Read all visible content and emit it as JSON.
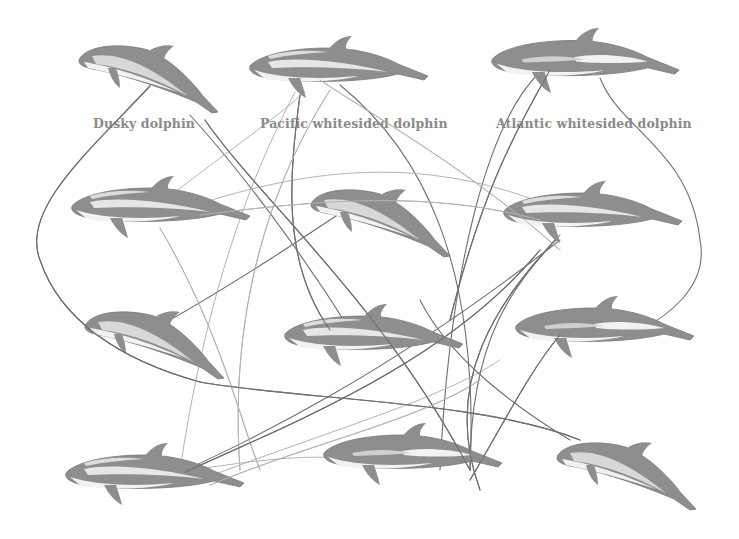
{
  "worksheet": {
    "reference_labels": [
      {
        "id": "dusky",
        "text": "Dusky dolphin",
        "x": 93,
        "y": 116
      },
      {
        "id": "pacific",
        "text": "Pacific whitesided dolphin",
        "x": 260,
        "y": 116
      },
      {
        "id": "atlantic",
        "text": "Atlantic whitesided dolphin",
        "x": 496,
        "y": 116
      }
    ],
    "colors": {
      "background": "#ffffff",
      "dolphin_dark": "#8e8e8e",
      "dolphin_light": "#f2f2f2",
      "label_text": "#8a8a8a",
      "pencil_dark": "#6f6f6f",
      "pencil_light": "#b4b4b4"
    },
    "dolphins": [
      {
        "name": "reference-dusky",
        "type": "dusky",
        "pose": "diving",
        "x": 78,
        "y": 40,
        "scale": 1.0
      },
      {
        "name": "reference-pacific",
        "type": "pacific",
        "pose": "swimming",
        "x": 248,
        "y": 38,
        "scale": 1.0
      },
      {
        "name": "reference-atlantic",
        "type": "atlantic",
        "pose": "swimming",
        "x": 490,
        "y": 30,
        "scale": 1.05
      },
      {
        "name": "unknown-1",
        "type": "pacific",
        "pose": "swimming",
        "x": 70,
        "y": 178,
        "scale": 1.0
      },
      {
        "name": "unknown-2",
        "type": "dusky",
        "pose": "diving",
        "x": 310,
        "y": 184,
        "scale": 1.0
      },
      {
        "name": "unknown-3",
        "type": "pacific",
        "pose": "swimming",
        "x": 502,
        "y": 183,
        "scale": 1.0
      },
      {
        "name": "unknown-4",
        "type": "dusky",
        "pose": "diving",
        "x": 84,
        "y": 306,
        "scale": 1.0
      },
      {
        "name": "unknown-5",
        "type": "pacific",
        "pose": "swimming",
        "x": 283,
        "y": 306,
        "scale": 1.0
      },
      {
        "name": "unknown-6",
        "type": "atlantic",
        "pose": "swimming",
        "x": 514,
        "y": 298,
        "scale": 1.0
      },
      {
        "name": "unknown-7",
        "type": "pacific",
        "pose": "swimming",
        "x": 64,
        "y": 445,
        "scale": 1.0
      },
      {
        "name": "unknown-8",
        "type": "atlantic",
        "pose": "swimming",
        "x": 322,
        "y": 425,
        "scale": 1.0
      },
      {
        "name": "unknown-9",
        "type": "dusky",
        "pose": "diving",
        "x": 556,
        "y": 437,
        "scale": 1.0
      }
    ],
    "connection_lines": [
      {
        "d": "M150 86 C 90 150, 20 210, 40 260 C 60 320, 120 360, 200 382",
        "tone": "dark"
      },
      {
        "d": "M190 115 C 240 170, 300 250, 350 330",
        "tone": "dark"
      },
      {
        "d": "M205 120 C 260 200, 380 300, 470 470",
        "tone": "dark"
      },
      {
        "d": "M295 92 C 260 160, 210 270, 180 470",
        "tone": "light"
      },
      {
        "d": "M300 95 C 290 170, 280 260, 330 330",
        "tone": "dark"
      },
      {
        "d": "M305 92 C 250 140, 170 190, 145 220",
        "tone": "light"
      },
      {
        "d": "M320 80 C 380 120, 470 170, 560 250",
        "tone": "light"
      },
      {
        "d": "M340 85 C 420 150, 480 260, 470 470",
        "tone": "dark"
      },
      {
        "d": "M330 90 C 260 200, 230 330, 240 470",
        "tone": "light"
      },
      {
        "d": "M540 72 C 490 120, 450 260, 440 470",
        "tone": "dark"
      },
      {
        "d": "M550 70 C 510 140, 480 200, 450 320",
        "tone": "dark"
      },
      {
        "d": "M600 78 C 620 130, 690 150, 700 240 C 710 290, 660 320, 640 330",
        "tone": "dark"
      },
      {
        "d": "M160 228 C 220 330, 240 420, 260 470",
        "tone": "light"
      },
      {
        "d": "M180 210 C 300 170, 420 150, 560 210",
        "tone": "light"
      },
      {
        "d": "M200 215 C 320 200, 430 190, 540 220",
        "tone": "light"
      },
      {
        "d": "M170 320 C 240 280, 300 240, 360 200",
        "tone": "dark"
      },
      {
        "d": "M200 382 C 300 400, 480 400, 580 440",
        "tone": "dark"
      },
      {
        "d": "M175 475 C 250 440, 380 380, 560 240",
        "tone": "dark"
      },
      {
        "d": "M185 472 C 300 420, 450 360, 540 250",
        "tone": "dark"
      },
      {
        "d": "M200 480 C 330 430, 440 400, 500 360",
        "tone": "light"
      },
      {
        "d": "M210 485 C 320 440, 420 420, 480 380",
        "tone": "light"
      },
      {
        "d": "M560 235 C 520 280, 470 330, 470 470",
        "tone": "dark"
      },
      {
        "d": "M555 240 C 500 300, 440 380, 480 490",
        "tone": "dark"
      },
      {
        "d": "M420 300 C 450 360, 520 410, 570 440",
        "tone": "dark"
      },
      {
        "d": "M560 335 C 530 370, 500 430, 470 480",
        "tone": "dark"
      },
      {
        "d": "M355 460 C 300 450, 200 470, 190 470",
        "tone": "light"
      }
    ]
  }
}
